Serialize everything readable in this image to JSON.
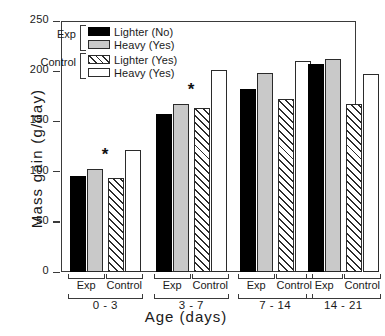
{
  "chart_data": {
    "type": "bar",
    "title": "",
    "xlabel": "Age  (days)",
    "ylabel": "Mass gain (g/day)",
    "ylim": [
      0,
      250
    ],
    "yticks": [
      0,
      50,
      100,
      150,
      200,
      250
    ],
    "grid": false,
    "legend_position": "top-left-inside",
    "categories": [
      "0 - 3",
      "3 - 7",
      "7 - 14",
      "14 - 21"
    ],
    "subgroups": [
      "Exp",
      "Control"
    ],
    "series": [
      {
        "name": "Lighter (No)",
        "group": "Exp",
        "style": "black",
        "values": [
          96,
          157,
          182,
          207
        ]
      },
      {
        "name": "Heavy (Yes)",
        "group": "Exp",
        "style": "gray",
        "values": [
          103,
          167,
          198,
          212
        ]
      },
      {
        "name": "Lighter (Yes)",
        "group": "Control",
        "style": "hatch",
        "values": [
          94,
          163,
          172,
          167
        ]
      },
      {
        "name": "Heavy (Yes)",
        "group": "Control",
        "style": "white",
        "values": [
          122,
          201,
          210,
          197
        ]
      }
    ],
    "annotations": [
      {
        "symbol": "*",
        "category": "0 - 3"
      },
      {
        "symbol": "*",
        "category": "3 - 7"
      }
    ]
  },
  "legend": {
    "categories": [
      {
        "name": "Exp"
      },
      {
        "name": "Control"
      }
    ],
    "entries": [
      {
        "label": "Lighter (No)",
        "style": "black"
      },
      {
        "label": "Heavy (Yes)",
        "style": "gray"
      },
      {
        "label": "Lighter (Yes)",
        "style": "hatch"
      },
      {
        "label": "Heavy (Yes)",
        "style": "white"
      }
    ]
  },
  "axes": {
    "y_title": "Mass gain (g/day)",
    "x_title": "Age  (days)",
    "y_tick_labels": [
      "250",
      "200",
      "150",
      "100",
      "50",
      "0"
    ]
  },
  "colors": {
    "bar_black": "#000000",
    "bar_gray": "#c9c9c9",
    "bar_white": "#ffffff",
    "axis": "#3a3a3a",
    "text": "#1a1a1a"
  }
}
